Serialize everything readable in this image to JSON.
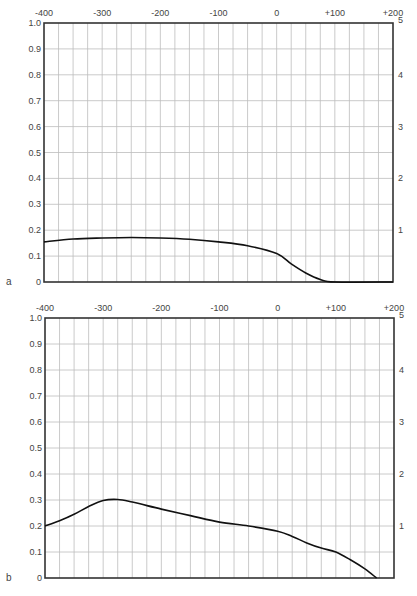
{
  "chart_data": [
    {
      "type": "line",
      "panel_label": "a",
      "title": "",
      "xlabel": "",
      "ylabel": "",
      "xlim": [
        -400,
        200
      ],
      "ylim": [
        0,
        1.0
      ],
      "y2lim": [
        0,
        5
      ],
      "grid": true,
      "x_minor_step": 25,
      "y_minor_step": 0.1,
      "x_tick_values": [
        -400,
        -300,
        -200,
        -100,
        0,
        100,
        200
      ],
      "x_tick_labels": [
        "-400",
        "-300",
        "-200",
        "-100",
        "0",
        "+100",
        "+200"
      ],
      "y_tick_values": [
        0,
        0.1,
        0.2,
        0.3,
        0.4,
        0.5,
        0.6,
        0.7,
        0.8,
        0.9,
        1.0
      ],
      "y_tick_labels": [
        "0",
        "0.1",
        "0.2",
        "0.3",
        "0.4",
        "0.5",
        "0.6",
        "0.7",
        "0.8",
        "0.9",
        "1.0"
      ],
      "y2_tick_values": [
        1,
        2,
        3,
        4,
        5
      ],
      "y2_tick_labels": [
        "1",
        "2",
        "3",
        "4",
        "5"
      ],
      "series": [
        {
          "name": "curve-a",
          "x": [
            -400,
            -350,
            -300,
            -250,
            -200,
            -150,
            -100,
            -50,
            0,
            25,
            50,
            75,
            100,
            200
          ],
          "y": [
            0.155,
            0.166,
            0.17,
            0.172,
            0.17,
            0.165,
            0.155,
            0.14,
            0.11,
            0.07,
            0.035,
            0.01,
            0,
            0
          ]
        }
      ]
    },
    {
      "type": "line",
      "panel_label": "b",
      "title": "",
      "xlabel": "",
      "ylabel": "",
      "xlim": [
        -400,
        200
      ],
      "ylim": [
        0,
        1.0
      ],
      "y2lim": [
        0,
        5
      ],
      "grid": true,
      "x_minor_step": 25,
      "y_minor_step": 0.1,
      "x_tick_values": [
        -400,
        -300,
        -200,
        -100,
        0,
        100,
        200
      ],
      "x_tick_labels": [
        "-400",
        "-300",
        "-200",
        "-100",
        "0",
        "+100",
        "+200"
      ],
      "y_tick_values": [
        0,
        0.1,
        0.2,
        0.3,
        0.4,
        0.5,
        0.6,
        0.7,
        0.8,
        0.9,
        1.0
      ],
      "y_tick_labels": [
        "0",
        "0.1",
        "0.2",
        "0.3",
        "0.4",
        "0.5",
        "0.6",
        "0.7",
        "0.8",
        "0.9",
        "1.0"
      ],
      "y2_tick_values": [
        1,
        2,
        3,
        4,
        5
      ],
      "y2_tick_labels": [
        "1",
        "2",
        "3",
        "4",
        "5"
      ],
      "series": [
        {
          "name": "curve-b",
          "x": [
            -400,
            -375,
            -350,
            -325,
            -300,
            -275,
            -250,
            -200,
            -150,
            -100,
            -50,
            0,
            25,
            50,
            75,
            100,
            125,
            150,
            170
          ],
          "y": [
            0.2,
            0.22,
            0.245,
            0.275,
            0.298,
            0.302,
            0.292,
            0.265,
            0.24,
            0.215,
            0.2,
            0.18,
            0.16,
            0.135,
            0.115,
            0.1,
            0.07,
            0.035,
            0
          ]
        }
      ]
    }
  ]
}
